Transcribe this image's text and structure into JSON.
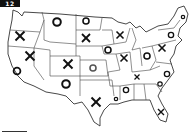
{
  "badge": {
    "label": "12"
  },
  "map": {
    "title": "United States tic-tac-toe map",
    "marks": [
      {
        "state": "Montana",
        "symbol": "O",
        "x": 57,
        "y": 22,
        "size": 9,
        "color": "#111111"
      },
      {
        "state": "North Dakota",
        "symbol": "O",
        "x": 86,
        "y": 21,
        "size": 7,
        "color": "#111111"
      },
      {
        "state": "South Dakota",
        "symbol": "X",
        "x": 86,
        "y": 38,
        "size": 8,
        "color": "#111111"
      },
      {
        "state": "Oregon",
        "symbol": "X",
        "x": 20,
        "y": 36,
        "size": 9,
        "color": "#111111"
      },
      {
        "state": "Nevada",
        "symbol": "X",
        "x": 30,
        "y": 56,
        "size": 9,
        "color": "#111111"
      },
      {
        "state": "California",
        "symbol": "O",
        "x": 17,
        "y": 71,
        "size": 8,
        "color": "#111111"
      },
      {
        "state": "Colorado",
        "symbol": "X",
        "x": 68,
        "y": 64,
        "size": 9,
        "color": "#111111"
      },
      {
        "state": "Kansas",
        "symbol": "O",
        "x": 93,
        "y": 68,
        "size": 7,
        "color": "#555555"
      },
      {
        "state": "New Mexico",
        "symbol": "O",
        "x": 66,
        "y": 84,
        "size": 9,
        "color": "#111111"
      },
      {
        "state": "Texas",
        "symbol": "X",
        "x": 96,
        "y": 102,
        "size": 9,
        "color": "#111111"
      },
      {
        "state": "Wisconsin",
        "symbol": "X",
        "x": 120,
        "y": 35,
        "size": 7,
        "color": "#111111"
      },
      {
        "state": "Iowa",
        "symbol": "O",
        "x": 108,
        "y": 50,
        "size": 7,
        "color": "#111111"
      },
      {
        "state": "Illinois",
        "symbol": "X",
        "x": 124,
        "y": 58,
        "size": 7,
        "color": "#111111"
      },
      {
        "state": "Ohio",
        "symbol": "O",
        "x": 147,
        "y": 56,
        "size": 7,
        "color": "#111111"
      },
      {
        "state": "Pennsylvania",
        "symbol": "X",
        "x": 162,
        "y": 48,
        "size": 7,
        "color": "#111111"
      },
      {
        "state": "New York",
        "symbol": "O",
        "x": 171,
        "y": 35,
        "size": 6,
        "color": "#111111"
      },
      {
        "state": "Maine",
        "symbol": "O",
        "x": 183,
        "y": 17,
        "size": 4,
        "color": "#111111"
      },
      {
        "state": "Tennessee",
        "symbol": "X",
        "x": 137,
        "y": 77,
        "size": 5,
        "color": "#111111"
      },
      {
        "state": "North Carolina",
        "symbol": "O",
        "x": 167,
        "y": 74,
        "size": 6,
        "color": "#111111"
      },
      {
        "state": "South Carolina",
        "symbol": "O",
        "x": 160,
        "y": 84,
        "size": 5,
        "color": "#111111"
      },
      {
        "state": "Mississippi",
        "symbol": "O",
        "x": 126,
        "y": 90,
        "size": 6,
        "color": "#111111"
      },
      {
        "state": "Louisiana",
        "symbol": "O",
        "x": 116,
        "y": 99,
        "size": 4,
        "color": "#111111"
      },
      {
        "state": "Florida",
        "symbol": "X",
        "x": 161,
        "y": 112,
        "size": 6,
        "color": "#111111"
      }
    ]
  }
}
